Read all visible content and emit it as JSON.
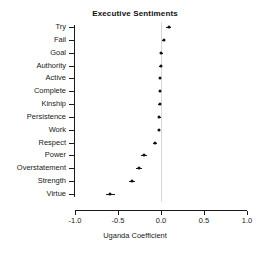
{
  "chart_data": {
    "type": "scatter",
    "title": "Executive Sentiments",
    "xlabel": "Uganda Coefficient",
    "ylabel": "",
    "xlim": [
      -1.0,
      1.0
    ],
    "xticks": [
      -1.0,
      -0.5,
      0.0,
      0.5,
      1.0
    ],
    "xtick_labels": [
      "-1.0",
      "-0.5",
      "0.0",
      "0.5",
      "1.0"
    ],
    "grid": false,
    "legend": "none",
    "zero_reference_line": 0.0,
    "categories": [
      "Try",
      "Fail",
      "Goal",
      "Authority",
      "Active",
      "Complete",
      "Kinship",
      "Persistence",
      "Work",
      "Respect",
      "Power",
      "Overstatement",
      "Strength",
      "Virtue"
    ],
    "values": [
      0.09,
      0.03,
      0.005,
      -0.005,
      -0.01,
      -0.01,
      -0.015,
      -0.02,
      -0.025,
      -0.07,
      -0.2,
      -0.26,
      -0.34,
      -0.59
    ],
    "ci_low": [
      0.06,
      0.01,
      -0.01,
      -0.02,
      -0.02,
      -0.02,
      -0.03,
      -0.035,
      -0.04,
      -0.095,
      -0.235,
      -0.295,
      -0.375,
      -0.645
    ],
    "ci_high": [
      0.12,
      0.05,
      0.02,
      0.01,
      0.005,
      0.005,
      0.0,
      -0.005,
      -0.01,
      -0.045,
      -0.165,
      -0.225,
      -0.305,
      -0.535
    ],
    "point_color": "#111111",
    "axis_color": "#1a1a1a",
    "zero_line_color": "#d8d8d8"
  }
}
